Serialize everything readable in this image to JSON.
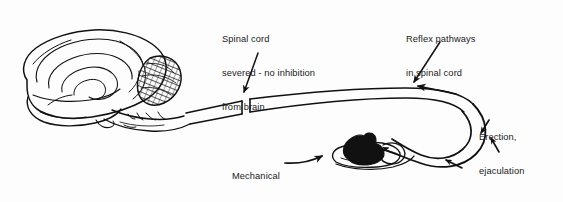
{
  "figure": {
    "background_color": "#fdfdfd",
    "ink_color": "#111111",
    "width": 563,
    "height": 202
  },
  "labels": {
    "spinal_cord_severed": {
      "line1": "Spinal cord",
      "line2": "severed - no inhibition",
      "line3": "from brain"
    },
    "reflex_pathways": {
      "line1": "Reflex pathways",
      "line2": "in spinal cord"
    },
    "erection_ejaculation": {
      "line1": "Erection,",
      "line2": "ejaculation"
    },
    "mechanical_stimulation": {
      "line1": "Mechanical",
      "line2": "stimulation"
    },
    "genitalia": {
      "line1": "genitalia"
    }
  },
  "structures": {
    "brain": "brain-lateral-view",
    "cerebellum": "cerebellum-hatched",
    "brainstem": "brainstem",
    "spinal_cord": "spinal-cord-band",
    "transection_gap": "spinal-cord-transection",
    "genitalia_organ": "genitalia-filled-organ",
    "afferent_arc": "afferent-sensory-pathway",
    "efferent_arc": "efferent-motor-pathway"
  }
}
